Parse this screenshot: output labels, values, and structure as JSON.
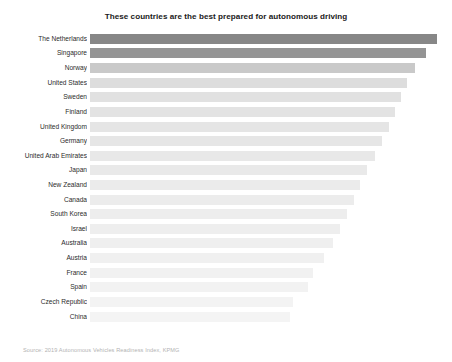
{
  "chart_data": {
    "type": "bar",
    "orientation": "horizontal",
    "title": "These countries are the best prepared for autonomous driving",
    "subtitle": "",
    "xlabel": "",
    "ylabel": "",
    "source": "Source: 2019 Autonomous Vehicles Readiness Index, KPMG",
    "grid": false,
    "legend": false,
    "xlim": [
      0,
      25
    ],
    "categories": [
      "The Netherlands",
      "Singapore",
      "Norway",
      "United States",
      "Sweden",
      "Finland",
      "United Kingdom",
      "Germany",
      "United Arab Emirates",
      "Japan",
      "New Zealand",
      "Canada",
      "South Korea",
      "Israel",
      "Australia",
      "Austria",
      "France",
      "Spain",
      "Czech Republic",
      "China"
    ],
    "values": [
      25.05,
      24.32,
      23.99,
      23.99,
      23.27,
      22.89,
      22.37,
      22.74,
      20.89,
      20.26,
      20.11,
      20.04,
      19.85,
      19.17,
      19.09,
      18.89,
      18.34,
      16.33,
      15.23,
      14.87
    ],
    "bar_colors": [
      "#878787",
      "#949494",
      "#c9c9c9",
      "#dddddd",
      "#e1e1e1",
      "#e3e3e3",
      "#e5e5e5",
      "#e6e6e6",
      "#e8e8e8",
      "#e9e9e9",
      "#ebebeb",
      "#ececec",
      "#ededed",
      "#eeeeee",
      "#efefef",
      "#f0f0f0",
      "#f1f1f1",
      "#f2f2f2",
      "#f3f3f3",
      "#f4f4f4"
    ],
    "bar_pixel_lengths": [
      347,
      336,
      325,
      317,
      311,
      305,
      299,
      292,
      285,
      277,
      270,
      264,
      257,
      250,
      243,
      234,
      223,
      218,
      203,
      200
    ],
    "accent_color": "#878787",
    "text_color": "#2b2b2b",
    "background": "#ffffff"
  }
}
